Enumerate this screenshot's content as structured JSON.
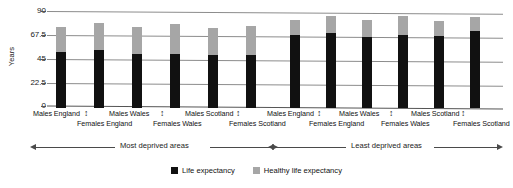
{
  "chart_data": {
    "type": "bar",
    "title": "",
    "subtitle": "",
    "xlabel": "",
    "ylabel": "Years",
    "ylim": [
      0,
      90
    ],
    "yticks": [
      0,
      22.5,
      45,
      67.5,
      90
    ],
    "ytick_labels": [
      "0",
      "22.5",
      "45",
      "67.5",
      "90"
    ],
    "grid": true,
    "stacked": true,
    "legend_position": "bottom",
    "categories": [
      "Males England",
      "Females England",
      "Males Wales",
      "Females Wales",
      "Males Scotland",
      "Females Scotland",
      "Males England",
      "Females England",
      "Males Wales",
      "Females Wales",
      "Males Scotland",
      "Females Scotland"
    ],
    "series": [
      {
        "name": "Life expectancy",
        "color": "#111111",
        "values": [
          50.0,
          52.0,
          49.0,
          49.0,
          48.0,
          47.5,
          66.0,
          67.5,
          64.0,
          65.5,
          64.5,
          69.0
        ]
      },
      {
        "name": "Healthy life expectancy",
        "color": "#a6a6a6",
        "values": [
          73.0,
          76.5,
          72.5,
          75.5,
          72.0,
          74.0,
          79.5,
          83.0,
          79.0,
          82.5,
          78.5,
          82.0
        ]
      }
    ],
    "groups": [
      {
        "label": "Most deprived areas",
        "start_index": 0,
        "end_index": 5
      },
      {
        "label": "Least deprived areas",
        "start_index": 6,
        "end_index": 11
      }
    ],
    "legend": [
      {
        "label": "Life expectancy",
        "color": "#111111"
      },
      {
        "label": "Healthy life expectancy",
        "color": "#a6a6a6"
      }
    ],
    "pair_arrow_glyph": "↕",
    "group_arrow_left": "←",
    "group_arrow_right": "→"
  },
  "colors": {
    "life_expectancy": "#111111",
    "healthy_life_expectancy": "#a6a6a6",
    "gridline": "#8c8c8c",
    "axis": "#555555",
    "background": "#ffffff"
  }
}
